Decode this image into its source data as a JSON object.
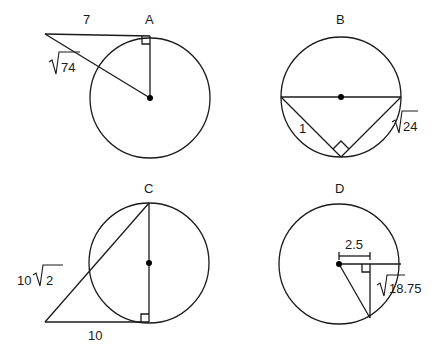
{
  "figures": [
    {
      "id": "A",
      "label": "A",
      "description": "Tangent segment and radius forming a right triangle",
      "tangent_length": "7",
      "hypotenuse_label": "74",
      "hypotenuse_prefix": "√"
    },
    {
      "id": "B",
      "label": "B",
      "description": "Triangle inscribed in semicircle with diameter as hypotenuse",
      "short_leg": "1",
      "long_leg_label": "24",
      "long_leg_prefix": "√"
    },
    {
      "id": "C",
      "label": "C",
      "description": "Right triangle with diameter leg and tangent base",
      "hypotenuse_coef": "10",
      "hypotenuse_root": "2",
      "base_length": "10"
    },
    {
      "id": "D",
      "label": "D",
      "description": "Radius, perpendicular chord half and segment",
      "horizontal_length": "2.5",
      "vertical_label": "18.75",
      "vertical_prefix": "√"
    }
  ],
  "colors": {
    "stroke": "#1a1a1a",
    "background": "#ffffff"
  }
}
